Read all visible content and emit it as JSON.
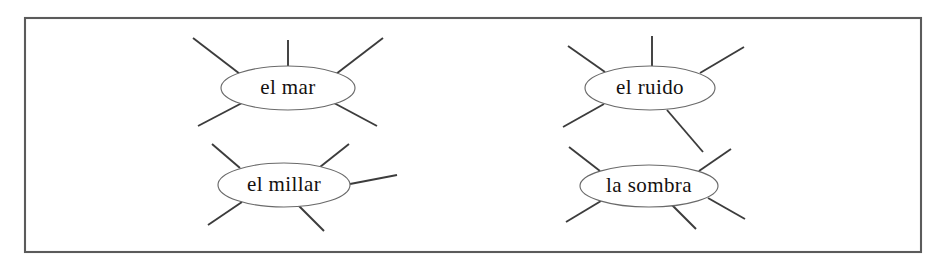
{
  "worksheet": {
    "type": "word-web-worksheet",
    "frame": {
      "x": 25,
      "y": 18,
      "width": 896,
      "height": 234,
      "stroke_color": "#5b5b5b"
    },
    "background_color": "#ffffff",
    "ink_color": "#14110f",
    "bubbles": [
      {
        "id": "el-mar",
        "label": "el mar",
        "cx": 288,
        "cy": 88,
        "rx": 67,
        "ry": 22,
        "ray_count": 5,
        "rays": [
          {
            "name": "top-left",
            "x1": 193,
            "y1": 38,
            "x2": 240,
            "y2": 74
          },
          {
            "name": "top-center",
            "x1": 288,
            "y1": 40,
            "x2": 288,
            "y2": 67
          },
          {
            "name": "top-right",
            "x1": 383,
            "y1": 38,
            "x2": 336,
            "y2": 74
          },
          {
            "name": "bottom-left",
            "x1": 198,
            "y1": 126,
            "x2": 242,
            "y2": 103
          },
          {
            "name": "bottom-right",
            "x1": 377,
            "y1": 126,
            "x2": 334,
            "y2": 103
          }
        ]
      },
      {
        "id": "el-ruido",
        "label": "el ruido",
        "cx": 650,
        "cy": 88,
        "rx": 65,
        "ry": 22,
        "ray_count": 5,
        "rays": [
          {
            "name": "top-left",
            "x1": 568,
            "y1": 46,
            "x2": 605,
            "y2": 72
          },
          {
            "name": "top-center",
            "x1": 652,
            "y1": 36,
            "x2": 652,
            "y2": 66
          },
          {
            "name": "top-right",
            "x1": 744,
            "y1": 47,
            "x2": 700,
            "y2": 73
          },
          {
            "name": "bottom-left",
            "x1": 563,
            "y1": 127,
            "x2": 604,
            "y2": 104
          },
          {
            "name": "bottom-right",
            "x1": 703,
            "y1": 152,
            "x2": 667,
            "y2": 110
          }
        ]
      },
      {
        "id": "el-millar",
        "label": "el millar",
        "cx": 284,
        "cy": 185,
        "rx": 66,
        "ry": 22,
        "ray_count": 5,
        "rays": [
          {
            "name": "top-left",
            "x1": 212,
            "y1": 144,
            "x2": 240,
            "y2": 168
          },
          {
            "name": "top-right",
            "x1": 349,
            "y1": 144,
            "x2": 320,
            "y2": 167
          },
          {
            "name": "right",
            "x1": 397,
            "y1": 175,
            "x2": 350,
            "y2": 184
          },
          {
            "name": "bottom-left",
            "x1": 208,
            "y1": 225,
            "x2": 242,
            "y2": 202
          },
          {
            "name": "bottom-right",
            "x1": 324,
            "y1": 231,
            "x2": 298,
            "y2": 205
          }
        ]
      },
      {
        "id": "la-sombra",
        "label": "la sombra",
        "cx": 649,
        "cy": 186,
        "rx": 69,
        "ry": 21,
        "ray_count": 5,
        "rays": [
          {
            "name": "top-left",
            "x1": 569,
            "y1": 147,
            "x2": 600,
            "y2": 171
          },
          {
            "name": "top-right",
            "x1": 731,
            "y1": 149,
            "x2": 699,
            "y2": 171
          },
          {
            "name": "bottom-left",
            "x1": 566,
            "y1": 222,
            "x2": 601,
            "y2": 201
          },
          {
            "name": "bottom-center",
            "x1": 696,
            "y1": 229,
            "x2": 671,
            "y2": 204
          },
          {
            "name": "bottom-right",
            "x1": 745,
            "y1": 219,
            "x2": 708,
            "y2": 198
          }
        ]
      }
    ]
  }
}
